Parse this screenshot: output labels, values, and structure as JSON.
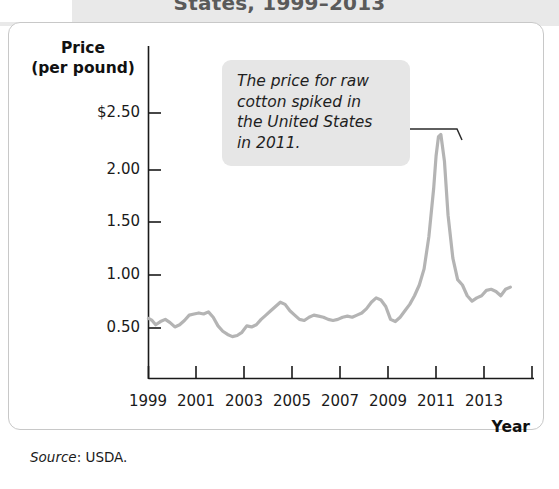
{
  "title": "States, 1999–2013",
  "frame": {
    "y_axis_title": "Price\n(per pound)",
    "y_axis_title_line1": "Price",
    "y_axis_title_line2": "(per pound)",
    "x_axis_title": "Year"
  },
  "annotation": {
    "text": "The price for raw cotton spiked in the United States in 2011.",
    "line1": "The price for raw",
    "line2": "cotton spiked in",
    "line3": "the United States",
    "line4": "in 2011.",
    "box_color": "#e6e6e6"
  },
  "source": {
    "label": "Source",
    "separator": ": ",
    "value": "USDA."
  },
  "colors": {
    "line": "#b4b4b4",
    "axis": "#1a1a1a",
    "frame_border": "#c8c8c8",
    "top_band": "#e9e9e9",
    "title_text": "#5a5a5a"
  },
  "chart_data": {
    "type": "line",
    "title": "States, 1999–2013",
    "subtitle": "",
    "xlabel": "Year",
    "ylabel": "Price (per pound)",
    "grid": false,
    "legend": "none",
    "xlim": [
      1999,
      2014.5
    ],
    "ylim": [
      0,
      2.65
    ],
    "xtick_labels": [
      "1999",
      "2001",
      "2003",
      "2005",
      "2007",
      "2009",
      "2011",
      "2013"
    ],
    "xtick_values": [
      1999,
      2001,
      2003,
      2005,
      2007,
      2009,
      2011,
      2013
    ],
    "ytick_labels": [
      "$2.50",
      "2.00",
      "1.50",
      "1.00",
      "0.50"
    ],
    "ytick_values": [
      2.5,
      2.0,
      1.5,
      1.0,
      0.5
    ],
    "annotations": [
      {
        "text": "The price for raw cotton spiked in the United States in 2011.",
        "points_to_x": 2011.1,
        "points_to_y": 2.3
      }
    ],
    "series": [
      {
        "name": "Raw cotton price (per pound)",
        "x": [
          1999.0,
          1999.15,
          1999.3,
          1999.5,
          1999.7,
          1999.9,
          2000.1,
          2000.3,
          2000.5,
          2000.7,
          2000.9,
          2001.1,
          2001.3,
          2001.5,
          2001.7,
          2001.9,
          2002.1,
          2002.3,
          2002.5,
          2002.7,
          2002.9,
          2003.1,
          2003.3,
          2003.5,
          2003.7,
          2003.9,
          2004.1,
          2004.3,
          2004.5,
          2004.7,
          2004.9,
          2005.1,
          2005.3,
          2005.5,
          2005.7,
          2005.9,
          2006.1,
          2006.3,
          2006.5,
          2006.7,
          2006.9,
          2007.1,
          2007.3,
          2007.5,
          2007.7,
          2007.9,
          2008.1,
          2008.3,
          2008.5,
          2008.7,
          2008.9,
          2009.1,
          2009.3,
          2009.5,
          2009.7,
          2009.9,
          2010.1,
          2010.3,
          2010.5,
          2010.7,
          2010.9,
          2011.0,
          2011.1,
          2011.2,
          2011.35,
          2011.5,
          2011.7,
          2011.9,
          2012.1,
          2012.3,
          2012.5,
          2012.7,
          2012.9,
          2013.1,
          2013.3,
          2013.5,
          2013.7,
          2013.9,
          2014.1
        ],
        "y": [
          0.59,
          0.57,
          0.53,
          0.56,
          0.58,
          0.55,
          0.51,
          0.53,
          0.57,
          0.62,
          0.63,
          0.64,
          0.63,
          0.65,
          0.6,
          0.52,
          0.47,
          0.44,
          0.42,
          0.43,
          0.46,
          0.52,
          0.51,
          0.53,
          0.58,
          0.62,
          0.66,
          0.7,
          0.74,
          0.72,
          0.66,
          0.62,
          0.58,
          0.57,
          0.6,
          0.62,
          0.61,
          0.6,
          0.58,
          0.57,
          0.58,
          0.6,
          0.61,
          0.6,
          0.62,
          0.64,
          0.68,
          0.74,
          0.78,
          0.76,
          0.7,
          0.58,
          0.56,
          0.6,
          0.66,
          0.72,
          0.8,
          0.9,
          1.05,
          1.35,
          1.8,
          2.1,
          2.28,
          2.3,
          2.05,
          1.55,
          1.15,
          0.95,
          0.9,
          0.8,
          0.75,
          0.78,
          0.8,
          0.85,
          0.86,
          0.84,
          0.8,
          0.86,
          0.88
        ]
      }
    ]
  }
}
